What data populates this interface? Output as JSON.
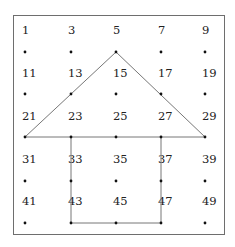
{
  "grid": {
    "columns_x": [
      25,
      71,
      116,
      161,
      205
    ],
    "label_rows_y": [
      24,
      67,
      110,
      153,
      195
    ],
    "dot_rows_y": [
      52,
      94,
      137,
      181,
      223
    ],
    "labels": [
      [
        "1",
        "3",
        "5",
        "7",
        "9"
      ],
      [
        "11",
        "13",
        "15",
        "17",
        "19"
      ],
      [
        "21",
        "23",
        "25",
        "27",
        "29"
      ],
      [
        "31",
        "33",
        "35",
        "37",
        "39"
      ],
      [
        "41",
        "43",
        "45",
        "47",
        "49"
      ]
    ]
  },
  "figure": {
    "roof_triangle": [
      [
        25,
        137
      ],
      [
        116,
        52
      ],
      [
        205,
        137
      ]
    ],
    "body_rectangle": [
      [
        71,
        137
      ],
      [
        71,
        223
      ],
      [
        161,
        223
      ],
      [
        161,
        137
      ]
    ],
    "line_color": "#777777",
    "dot_color": "#111111"
  }
}
